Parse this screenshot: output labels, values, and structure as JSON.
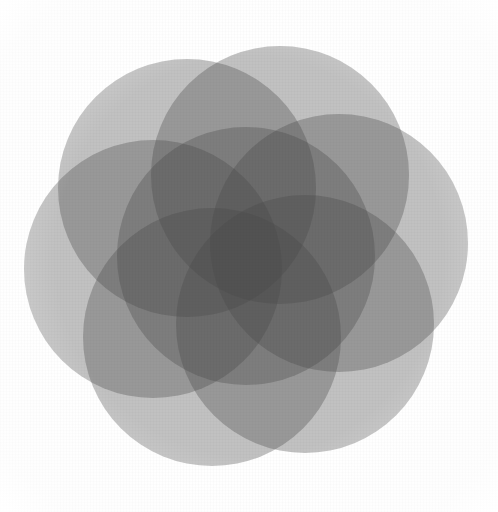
{
  "artwork": {
    "title": "Seed of Life",
    "description": "Seven overlapping translucent gray circles forming a six-petal rosette",
    "canvas": {
      "width": 498,
      "height": 512,
      "background_color": "#ffffff"
    },
    "geometry": {
      "center_x": 246,
      "center_y": 256,
      "circle_radius": 129,
      "ring_radius": 94,
      "ring_count": 6,
      "include_center_circle": true,
      "ring_rotation_degrees": -8,
      "bounding_box": {
        "left": 23,
        "top": 33,
        "right": 469,
        "bottom": 479
      }
    },
    "palette": {
      "base_fill": "#4a4a4a",
      "base_opacity": 0.34,
      "stroke": "none",
      "overlap_1": "#e6e6e6",
      "overlap_2": "#c9c9c9",
      "overlap_3": "#9d9d9d",
      "overlap_4": "#7d7d7d",
      "overlap_5": "#636363",
      "overlap_6": "#4e4e4e",
      "overlap_7": "#3a3a3a"
    },
    "circles": [
      {
        "id": "circle-center",
        "label": "Center circle",
        "cx": 246,
        "cy": 256,
        "r": 129,
        "angle_degrees": null
      },
      {
        "id": "circle-1",
        "label": "Ring circle 1",
        "cx": 339,
        "cy": 243,
        "r": 129,
        "angle_degrees": -8
      },
      {
        "id": "circle-2",
        "label": "Ring circle 2",
        "cx": 305,
        "cy": 324,
        "r": 129,
        "angle_degrees": 52
      },
      {
        "id": "circle-3",
        "label": "Ring circle 3",
        "cx": 212,
        "cy": 337,
        "r": 129,
        "angle_degrees": 112
      },
      {
        "id": "circle-4",
        "label": "Ring circle 4",
        "cx": 153,
        "cy": 269,
        "r": 129,
        "angle_degrees": 172
      },
      {
        "id": "circle-5",
        "label": "Ring circle 5",
        "cx": 187,
        "cy": 188,
        "r": 129,
        "angle_degrees": 232
      },
      {
        "id": "circle-6",
        "label": "Ring circle 6",
        "cx": 280,
        "cy": 175,
        "r": 129,
        "angle_degrees": 292
      }
    ],
    "texture": {
      "type": "paper-canvas-weave",
      "opacity": 0.3
    }
  }
}
